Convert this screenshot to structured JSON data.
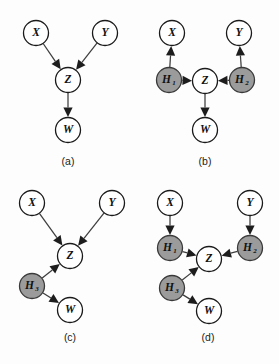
{
  "figure": {
    "background_color": "#fdfdfd",
    "node_fill_observed": "#ffffff",
    "node_fill_latent": "#9b9b9b",
    "node_stroke": "#1a1a1a",
    "edge_color": "#3d3d3d"
  },
  "panels": [
    {
      "id": "a",
      "caption": "(a)",
      "caption_x": 68,
      "caption_y": 162,
      "nodes": [
        {
          "name": "X",
          "base": "X",
          "sub": "",
          "x": 36,
          "y": 33,
          "r": 12.5,
          "kind": "observed"
        },
        {
          "name": "Y",
          "base": "Y",
          "sub": "",
          "x": 105,
          "y": 33,
          "r": 12.5,
          "kind": "observed"
        },
        {
          "name": "Z",
          "base": "Z",
          "sub": "",
          "x": 68,
          "y": 80,
          "r": 12.5,
          "kind": "observed"
        },
        {
          "name": "W",
          "base": "W",
          "sub": "",
          "x": 68,
          "y": 130,
          "r": 12.5,
          "kind": "observed"
        }
      ],
      "edges": [
        {
          "from": "X",
          "to": "Z"
        },
        {
          "from": "Y",
          "to": "Z"
        },
        {
          "from": "Z",
          "to": "W"
        }
      ]
    },
    {
      "id": "b",
      "caption": "(b)",
      "caption_x": 205,
      "caption_y": 162,
      "nodes": [
        {
          "name": "X",
          "base": "X",
          "sub": "",
          "x": 172,
          "y": 33,
          "r": 12.5,
          "kind": "observed"
        },
        {
          "name": "Y",
          "base": "Y",
          "sub": "",
          "x": 239,
          "y": 33,
          "r": 12.5,
          "kind": "observed"
        },
        {
          "name": "H1",
          "base": "H",
          "sub": "1",
          "x": 169,
          "y": 80,
          "r": 12.5,
          "kind": "latent"
        },
        {
          "name": "H2",
          "base": "H",
          "sub": "2",
          "x": 242,
          "y": 80,
          "r": 12.5,
          "kind": "latent"
        },
        {
          "name": "Z",
          "base": "Z",
          "sub": "",
          "x": 205,
          "y": 81,
          "r": 12.5,
          "kind": "observed"
        },
        {
          "name": "W",
          "base": "W",
          "sub": "",
          "x": 205,
          "y": 130,
          "r": 12.5,
          "kind": "observed"
        }
      ],
      "edges": [
        {
          "from": "H1",
          "to": "X"
        },
        {
          "from": "H2",
          "to": "Y"
        },
        {
          "from": "H1",
          "to": "Z"
        },
        {
          "from": "H2",
          "to": "Z"
        },
        {
          "from": "Z",
          "to": "W"
        }
      ]
    },
    {
      "id": "c",
      "caption": "(c)",
      "caption_x": 70,
      "caption_y": 338,
      "nodes": [
        {
          "name": "X",
          "base": "X",
          "sub": "",
          "x": 32,
          "y": 203,
          "r": 12.5,
          "kind": "observed"
        },
        {
          "name": "Y",
          "base": "Y",
          "sub": "",
          "x": 112,
          "y": 203,
          "r": 12.5,
          "kind": "observed"
        },
        {
          "name": "Z",
          "base": "Z",
          "sub": "",
          "x": 70,
          "y": 256,
          "r": 12.5,
          "kind": "observed"
        },
        {
          "name": "H3",
          "base": "H",
          "sub": "3",
          "x": 32,
          "y": 286,
          "r": 12.5,
          "kind": "latent"
        },
        {
          "name": "W",
          "base": "W",
          "sub": "",
          "x": 70,
          "y": 310,
          "r": 12.5,
          "kind": "observed"
        }
      ],
      "edges": [
        {
          "from": "X",
          "to": "Z"
        },
        {
          "from": "Y",
          "to": "Z"
        },
        {
          "from": "H3",
          "to": "Z"
        },
        {
          "from": "H3",
          "to": "W"
        }
      ]
    },
    {
      "id": "d",
      "caption": "(d)",
      "caption_x": 208,
      "caption_y": 338,
      "nodes": [
        {
          "name": "X",
          "base": "X",
          "sub": "",
          "x": 170,
          "y": 203,
          "r": 12.5,
          "kind": "observed"
        },
        {
          "name": "Y",
          "base": "Y",
          "sub": "",
          "x": 250,
          "y": 203,
          "r": 12.5,
          "kind": "observed"
        },
        {
          "name": "H1",
          "base": "H",
          "sub": "1",
          "x": 170,
          "y": 248,
          "r": 12.5,
          "kind": "latent"
        },
        {
          "name": "H2",
          "base": "H",
          "sub": "2",
          "x": 250,
          "y": 248,
          "r": 12.5,
          "kind": "latent"
        },
        {
          "name": "Z",
          "base": "Z",
          "sub": "",
          "x": 209,
          "y": 259,
          "r": 12.5,
          "kind": "observed"
        },
        {
          "name": "H3",
          "base": "H",
          "sub": "3",
          "x": 172,
          "y": 288,
          "r": 12.5,
          "kind": "latent"
        },
        {
          "name": "W",
          "base": "W",
          "sub": "",
          "x": 209,
          "y": 311,
          "r": 12.5,
          "kind": "observed"
        }
      ],
      "edges": [
        {
          "from": "X",
          "to": "H1"
        },
        {
          "from": "Y",
          "to": "H2"
        },
        {
          "from": "H1",
          "to": "Z"
        },
        {
          "from": "H2",
          "to": "Z"
        },
        {
          "from": "H3",
          "to": "Z"
        },
        {
          "from": "H3",
          "to": "W"
        }
      ]
    }
  ]
}
